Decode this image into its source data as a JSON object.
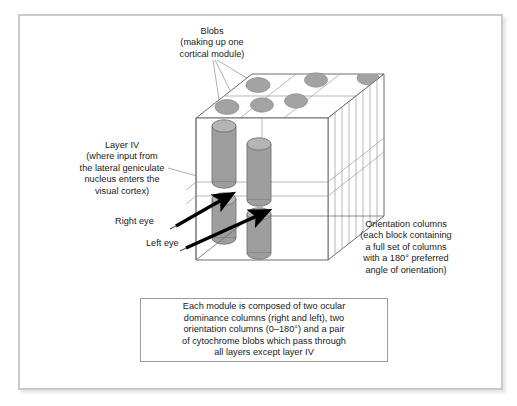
{
  "figure": {
    "background_color": "#ffffff",
    "frame_color": "#c9c9c9"
  },
  "labels": {
    "blobs": "Blobs\n(making up one\ncortical module)",
    "layer_iv": "Layer IV\n(where input from\nthe lateral geniculate\nnucleus enters the\nvisual cortex)",
    "right_eye": "Right eye",
    "left_eye": "Left eye",
    "orientation_columns": "Orientation columns\n(each block containing\na full set of columns\nwith a 180° preferred\nangle of orientation)"
  },
  "caption": {
    "text": "Each module is composed of two ocular\ndominance columns (right and left), two\norientation columns (0–180°) and a pair\nof cytochrome blobs which pass through\nall layers except layer IV",
    "border_color": "#9a9a9a"
  },
  "diagram": {
    "block_outline_color": "#6e6e6e",
    "blob_fill": "#a3a3a3",
    "blob_stroke": "#8a8a8a",
    "cylinder_fill": "#9e9e9e",
    "cylinder_stroke": "#6a6a6a",
    "cylinder_top_fill": "#b5b5b5",
    "arrow_color": "#000000",
    "leader_color": "#8c8c8c",
    "blob_count": 6,
    "cylinder_count": 4,
    "orientation_column_lines": 7,
    "preferred_angle_range": "0–180°"
  }
}
